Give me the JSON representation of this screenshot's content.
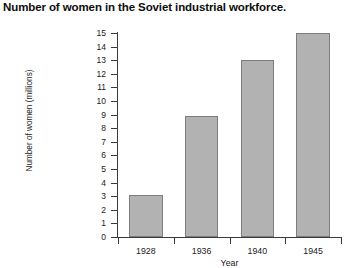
{
  "chart_data": {
    "type": "bar",
    "title": "Number of women in the Soviet industrial workforce.",
    "xlabel": "Year",
    "ylabel": "Number of women (millions)",
    "categories": [
      "1928",
      "1936",
      "1940",
      "1945"
    ],
    "values": [
      3.1,
      8.9,
      13.0,
      15.0
    ],
    "ylim": [
      0,
      15
    ],
    "ytick_step": 1,
    "yticks": [
      "0",
      "1",
      "2",
      "3",
      "4",
      "5",
      "6",
      "7",
      "8",
      "9",
      "10",
      "11",
      "12",
      "13",
      "14",
      "15"
    ],
    "grid": false,
    "legend": "none",
    "bar_fill_color": "#b2b2b2",
    "bar_edge_color": "#7d7d7d",
    "axis_color": "#3a3a3a",
    "background_color": "#ffffff"
  }
}
